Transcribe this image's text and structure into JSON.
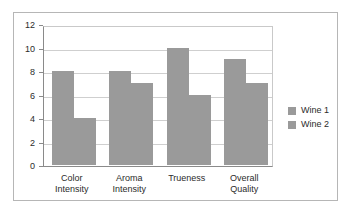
{
  "chart_data": {
    "type": "bar",
    "title": "",
    "subtitle": "",
    "xlabel": "",
    "ylabel": "",
    "categories": [
      "Color\nIntensity",
      "Aroma\nIntensity",
      "Trueness",
      "Overall\nQuality"
    ],
    "series": [
      {
        "name": "Wine 1",
        "values": [
          8,
          8,
          10,
          9
        ],
        "color": "#9a9a9a"
      },
      {
        "name": "Wine 2",
        "values": [
          4,
          7,
          6,
          7
        ],
        "color": "#9a9a9a"
      }
    ],
    "ylim": [
      0,
      12
    ],
    "ytick_labels": [
      "12",
      "10",
      "8",
      "6",
      "4",
      "2",
      "0"
    ],
    "ytick_values": [
      12,
      10,
      8,
      6,
      4,
      2,
      0
    ],
    "grid": true,
    "legend_position": "right",
    "colors": {
      "bar_fill": "#9a9a9a",
      "gridline": "#cfcfcf",
      "axis": "#8a8a8a",
      "frame_border": "#b6b6b6",
      "plot_background": "#ffffff",
      "text": "#2b2b2b"
    }
  }
}
